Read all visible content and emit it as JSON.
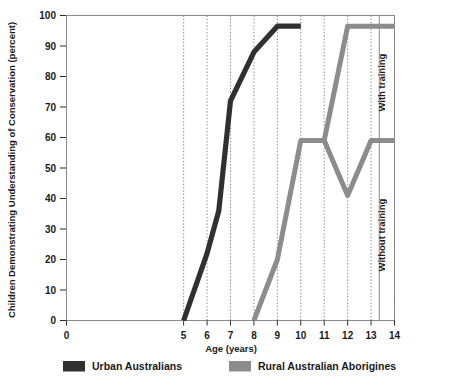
{
  "chart_data": {
    "type": "line",
    "title": "",
    "xlabel": "Age (years)",
    "ylabel": "Children Demonstrating Understanding of Conservation (percent)",
    "xlim": [
      0,
      14
    ],
    "ylim": [
      0,
      100
    ],
    "xticks": [
      0,
      5,
      6,
      7,
      8,
      9,
      10,
      11,
      12,
      13,
      14
    ],
    "xtick_labels": [
      "0",
      "5",
      "6",
      "7",
      "8",
      "9",
      "10",
      "11",
      "12",
      "13",
      "14"
    ],
    "yticks": [
      0,
      10,
      20,
      30,
      40,
      50,
      60,
      70,
      80,
      90,
      100
    ],
    "ytick_labels": [
      "0",
      "10",
      "20",
      "30",
      "40",
      "50",
      "60",
      "70",
      "80",
      "90",
      "100"
    ],
    "grid": "vertical-dotted",
    "legend_position": "below-plot",
    "series": [
      {
        "name": "Urban Australians",
        "color": "#303030",
        "width": 5.2,
        "points": [
          [
            5,
            0
          ],
          [
            6,
            22
          ],
          [
            6.5,
            36
          ],
          [
            7,
            72
          ],
          [
            8,
            88
          ],
          [
            9,
            96.5
          ],
          [
            10,
            96.5
          ]
        ]
      },
      {
        "name": "Rural Australian Aborigines",
        "color": "#8c8c8c",
        "width": 5.0,
        "points": [
          [
            8,
            0
          ],
          [
            9,
            20
          ],
          [
            10,
            59
          ],
          [
            11,
            59
          ],
          [
            12,
            96.5
          ],
          [
            13,
            96.5
          ],
          [
            14,
            96.5
          ]
        ]
      },
      {
        "name": "Rural Australian Aborigines (without training branch)",
        "color": "#8c8c8c",
        "width": 5.0,
        "points": [
          [
            11,
            59
          ],
          [
            12,
            41
          ],
          [
            13,
            59
          ],
          [
            14,
            59
          ]
        ]
      }
    ],
    "annotations": [
      {
        "text": "With training",
        "x": 13.6,
        "y": 78,
        "rotation": -90
      },
      {
        "text": "Without training",
        "x": 13.6,
        "y": 28,
        "rotation": -90
      }
    ],
    "legend": [
      {
        "label": "Urban Australians",
        "color": "#303030"
      },
      {
        "label": "Rural Australian Aborigines",
        "color": "#8c8c8c"
      }
    ]
  }
}
